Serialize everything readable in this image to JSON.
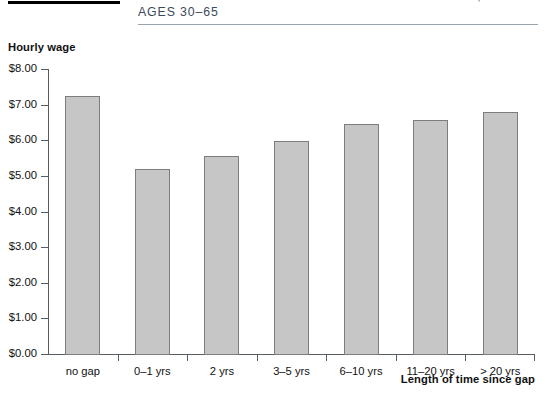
{
  "header": {
    "title_line1": "The Effect of Employment Gaps for Women,",
    "title_line2": "Ages 30–65"
  },
  "axes": {
    "y_title": "Hourly wage",
    "x_title": "Length of time since gap"
  },
  "chart_data": {
    "type": "bar",
    "title": "The Effect of Employment Gaps for Women, Ages 30–65",
    "xlabel": "Length of time since gap",
    "ylabel": "Hourly wage",
    "ylim": [
      0,
      8
    ],
    "ytick_labels": [
      "$0.00",
      "$1.00",
      "$2.00",
      "$3.00",
      "$4.00",
      "$5.00",
      "$6.00",
      "$7.00",
      "$8.00"
    ],
    "ytick_values": [
      0,
      1,
      2,
      3,
      4,
      5,
      6,
      7,
      8
    ],
    "grid": false,
    "legend": "none",
    "categories": [
      "no gap",
      "0–1 yrs",
      "2 yrs",
      "3–5 yrs",
      "6–10 yrs",
      "11–20 yrs",
      "> 20 yrs"
    ],
    "values": [
      7.25,
      5.2,
      5.55,
      5.97,
      6.45,
      6.57,
      6.78
    ],
    "bar_color": "#c6c6c6",
    "bar_border_color": "#7d7d7d"
  }
}
